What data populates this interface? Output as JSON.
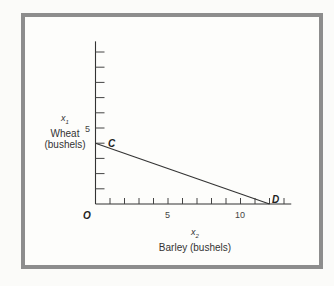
{
  "chart_data": {
    "type": "line",
    "title": "",
    "xlabel": "Barley (bushels)",
    "xlabel_var": "x",
    "xlabel_sub": "2",
    "ylabel": "Wheat (bushels)",
    "ylabel_var": "x",
    "ylabel_sub": "1",
    "ylabel_line1": "Wheat",
    "ylabel_line2": "(bushels)",
    "xlim": [
      0,
      13.5
    ],
    "ylim": [
      0,
      10.7
    ],
    "x_ticks": [
      1,
      2,
      3,
      4,
      5,
      6,
      7,
      8,
      9,
      10,
      11,
      12,
      13
    ],
    "y_ticks": [
      1,
      2,
      3,
      4,
      5,
      6,
      7,
      8,
      9,
      10
    ],
    "x_tick_labels": [
      {
        "value": 5,
        "label": "5"
      },
      {
        "value": 10,
        "label": "10"
      }
    ],
    "y_tick_labels": [
      {
        "value": 5,
        "label": "5"
      }
    ],
    "origin_label": "O",
    "grid": false,
    "legend": null,
    "series": [
      {
        "name": "CD",
        "points": [
          {
            "x": 0,
            "y": 4,
            "label": "C"
          },
          {
            "x": 12,
            "y": 0,
            "label": "D"
          }
        ]
      }
    ],
    "annotations": [
      "C",
      "D",
      "O"
    ]
  },
  "labels": {
    "origin": "O",
    "point_c": "C",
    "point_d": "D",
    "y_tick_5": "5",
    "x_tick_5": "5",
    "x_tick_10": "10",
    "y_var": "x",
    "y_sub": "1",
    "y_line1": "Wheat",
    "y_line2": "(bushels)",
    "x_var": "x",
    "x_sub": "2",
    "x_line": "Barley (bushels)"
  },
  "colors": {
    "frame": "#8d8d8d",
    "axis": "#333333",
    "line": "#333333",
    "background": "#fdfdfb"
  }
}
